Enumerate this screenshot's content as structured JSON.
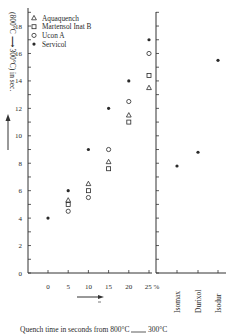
{
  "chart_data": {
    "type": "scatter",
    "title": "",
    "ylabel": "(800°C ⟶ 300°C) in sec.",
    "xlabel": "Quench time in seconds from 800°C ___ 300°C",
    "ylim": [
      0,
      19
    ],
    "yticks": [
      0,
      2,
      4,
      6,
      8,
      10,
      12,
      14,
      16,
      18
    ],
    "grid": false,
    "legend_position": "top-left",
    "panels": [
      {
        "name": "concentration",
        "x_tick_labels": [
          "0",
          "5",
          "10",
          "15",
          "20",
          "25 %"
        ],
        "x": [
          0,
          5,
          10,
          15,
          20,
          25
        ],
        "series": [
          {
            "name": "Aquaquench",
            "marker": "triangle",
            "points": [
              [
                5,
                5.3
              ],
              [
                10,
                6.5
              ],
              [
                15,
                8.1
              ],
              [
                20,
                11.5
              ],
              [
                25,
                13.5
              ]
            ]
          },
          {
            "name": "Martensol Inat B",
            "marker": "square",
            "points": [
              [
                5,
                5.0
              ],
              [
                10,
                6.0
              ],
              [
                15,
                7.6
              ],
              [
                20,
                11.0
              ],
              [
                25,
                14.4
              ]
            ]
          },
          {
            "name": "Ucon A",
            "marker": "circle",
            "points": [
              [
                5,
                4.5
              ],
              [
                10,
                5.5
              ],
              [
                15,
                9.0
              ],
              [
                20,
                12.5
              ],
              [
                25,
                16.0
              ]
            ]
          },
          {
            "name": "Servicol",
            "marker": "star",
            "points": [
              [
                0,
                4.0
              ],
              [
                5,
                6.0
              ],
              [
                10,
                9.0
              ],
              [
                15,
                12.0
              ],
              [
                20,
                14.0
              ],
              [
                25,
                17.0
              ]
            ]
          }
        ]
      },
      {
        "name": "oils",
        "categories": [
          "Isomax",
          "Durixol",
          "Isodur"
        ],
        "series": [
          {
            "name": "oil",
            "marker": "star",
            "values": [
              7.8,
              8.8,
              15.5
            ]
          }
        ]
      }
    ]
  },
  "legend": [
    {
      "marker": "triangle",
      "label": "Aquaquench"
    },
    {
      "marker": "square",
      "label": "Martensol Inat B"
    },
    {
      "marker": "circle",
      "label": "Ucon A"
    },
    {
      "marker": "star",
      "label": "Servicol"
    }
  ],
  "labels": {
    "ylabel": "(800°C ⟶ 300°C) in sec.",
    "xlabel_prefix": "Quench time in seconds from 800°C",
    "xlabel_suffix": "300°C"
  },
  "colors": {
    "ink": "#2a2a2a",
    "axis": "#333333"
  }
}
